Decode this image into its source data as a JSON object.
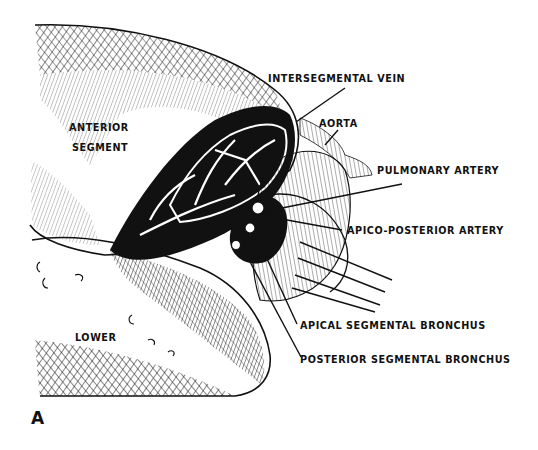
{
  "figure": {
    "panel_letter": "A",
    "ink_color": "#111111",
    "background": "#ffffff",
    "labels": {
      "intersegmental_vein": "INTERSEGMENTAL VEIN",
      "aorta": "AORTA",
      "anterior_segment_line1": "ANTERIOR",
      "anterior_segment_line2": "SEGMENT",
      "pulmonary_artery": "PULMONARY ARTERY",
      "apico_posterior_artery": "APICO-POSTERIOR ARTERY",
      "lower": "LOWER",
      "apical_segmental_bronchus": "APICAL SEGMENTAL BRONCHUS",
      "posterior_segmental_bronchus": "POSTERIOR SEGMENTAL BRONCHUS"
    }
  }
}
